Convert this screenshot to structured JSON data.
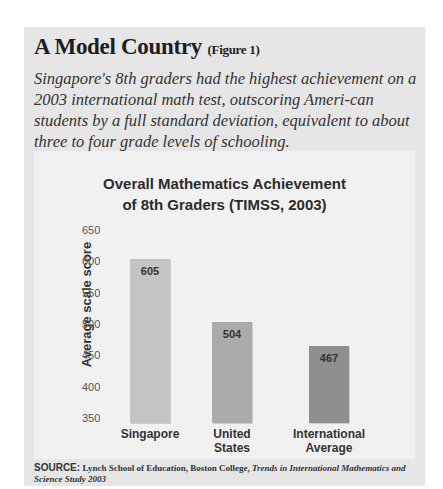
{
  "header": {
    "title": "A Model Country",
    "figure_label": "(Figure 1)",
    "subtitle": "Singapore's 8th graders had the highest achievement on a 2003 international math test, outscoring Ameri-can students by a full standard deviation, equivalent to about three to four grade levels of schooling."
  },
  "source": {
    "key": "SOURCE:",
    "org": "Lynch School of Education, Boston College,",
    "publication": "Trends in International Mathematics and Science Study 2003"
  },
  "chart_data": {
    "type": "bar",
    "title": "Overall Mathematics Achievement of 8th Graders (TIMSS, 2003)",
    "title_line1": "Overall Mathematics Achievement",
    "title_line2": "of 8th Graders (TIMSS, 2003)",
    "xlabel": "",
    "ylabel": "Average scale score",
    "ylim": [
      350,
      650
    ],
    "yticks": [
      "650",
      "600",
      "550",
      "500",
      "450",
      "400",
      "350"
    ],
    "grid": false,
    "legend": null,
    "categories": [
      "Singapore",
      "United States",
      "International Average"
    ],
    "category_lines": [
      [
        "Singapore"
      ],
      [
        "United",
        "States"
      ],
      [
        "International",
        "Average"
      ]
    ],
    "values": [
      605,
      504,
      467
    ],
    "value_labels": [
      "605",
      "504",
      "467"
    ],
    "colors": [
      "#c4c4c4",
      "#ababab",
      "#8f8f8f"
    ]
  }
}
